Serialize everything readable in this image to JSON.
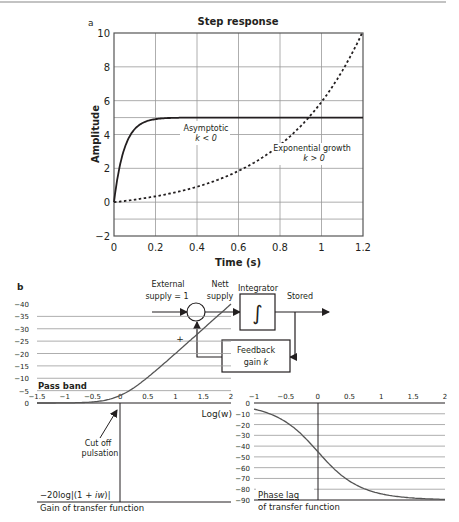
{
  "panel_a": {
    "label": "a",
    "title": "Step response",
    "xlabel": "Time (s)",
    "ylabel": "Amplitude",
    "x_ticks": [
      "0",
      "0.2",
      "0.4",
      "0.6",
      "0.8",
      "1",
      "1.2"
    ],
    "y_ticks": [
      "10",
      "8",
      "6",
      "4",
      "2",
      "0",
      "−2"
    ],
    "annotation_asymptotic": "Asymptotic",
    "annotation_asymptotic_k": "k < 0",
    "annotation_growth": "Exponential growth",
    "annotation_growth_k": "k > 0"
  },
  "panel_b": {
    "label": "b",
    "external_supply_line1": "External",
    "external_supply_line2": "supply = 1",
    "nett_supply_line1": "Nett",
    "nett_supply_line2": "supply",
    "integrator": "Integrator",
    "integral_symbol": "∫",
    "stored": "Stored",
    "plus": "+",
    "feedback_line1": "Feedback",
    "feedback_line2": "gain k"
  },
  "bode": {
    "pass_band": "Pass band",
    "log_w": "Log(w)",
    "gain_x_ticks": [
      "−1.5",
      "−1",
      "−0.5",
      "0",
      "0.5",
      "1",
      "1.5",
      "2"
    ],
    "gain_y_ticks": [
      "0",
      "−5",
      "−10",
      "−15",
      "−20",
      "−25",
      "−30",
      "−35",
      "−40"
    ],
    "cut_off_line1": "Cut off",
    "cut_off_line2": "pulsation",
    "gain_formula": "−20log|(1 + iw)|",
    "gain_caption": "Gain of transfer function",
    "phase_x_ticks": [
      "−1",
      "−0.5",
      "0",
      "0.5",
      "1",
      "1.5",
      "2"
    ],
    "phase_y_ticks": [
      "0",
      "−10",
      "−20",
      "−30",
      "−40",
      "−50",
      "−60",
      "−70",
      "−80",
      "−90"
    ],
    "phase_title": "Phase lag",
    "phase_caption": "of transfer function"
  },
  "chart_data": [
    {
      "type": "line",
      "title": "Step response",
      "xlabel": "Time (s)",
      "ylabel": "Amplitude",
      "xlim": [
        0,
        1.2
      ],
      "ylim": [
        -2,
        10
      ],
      "grid": true,
      "series": [
        {
          "name": "Asymptotic k < 0",
          "style": "solid",
          "x": [
            0,
            0.025,
            0.05,
            0.1,
            0.15,
            0.2,
            0.3,
            0.4,
            0.6,
            0.8,
            1.0,
            1.2
          ],
          "y": [
            0,
            1.97,
            3.16,
            4.32,
            4.75,
            4.91,
            4.99,
            5.0,
            5.0,
            5.0,
            5.0,
            5.0
          ]
        },
        {
          "name": "Exponential growth k > 0",
          "style": "dashed",
          "x": [
            0,
            0.2,
            0.4,
            0.6,
            0.8,
            0.9,
            1.0,
            1.1,
            1.2
          ],
          "y": [
            0,
            0.5,
            1.2,
            2.3,
            4.0,
            5.0,
            6.4,
            8.0,
            10.0
          ]
        }
      ]
    },
    {
      "type": "line",
      "title": "Gain of transfer function",
      "subtitle": "−20log|(1 + iw)|",
      "xlabel": "Log(w)",
      "xlim": [
        -1.5,
        2
      ],
      "ylim": [
        -40,
        0
      ],
      "grid": true,
      "series": [
        {
          "name": "Gain",
          "x": [
            -1.5,
            -1,
            -0.5,
            0,
            0.25,
            0.5,
            1,
            1.5,
            2
          ],
          "y": [
            0,
            0,
            -0.5,
            -3,
            -5.5,
            -9,
            -20,
            -30,
            -40
          ]
        }
      ],
      "annotation": "Cut off pulsation"
    },
    {
      "type": "line",
      "title": "Phase lag of transfer function",
      "xlim": [
        -1,
        2
      ],
      "ylim": [
        -90,
        0
      ],
      "grid": true,
      "series": [
        {
          "name": "Phase",
          "x": [
            -1,
            -0.5,
            -0.25,
            0,
            0.25,
            0.5,
            0.75,
            1,
            1.5,
            2
          ],
          "y": [
            -6,
            -17,
            -29,
            -45,
            -61,
            -73,
            -80,
            -84,
            -88,
            -89
          ]
        }
      ]
    }
  ]
}
